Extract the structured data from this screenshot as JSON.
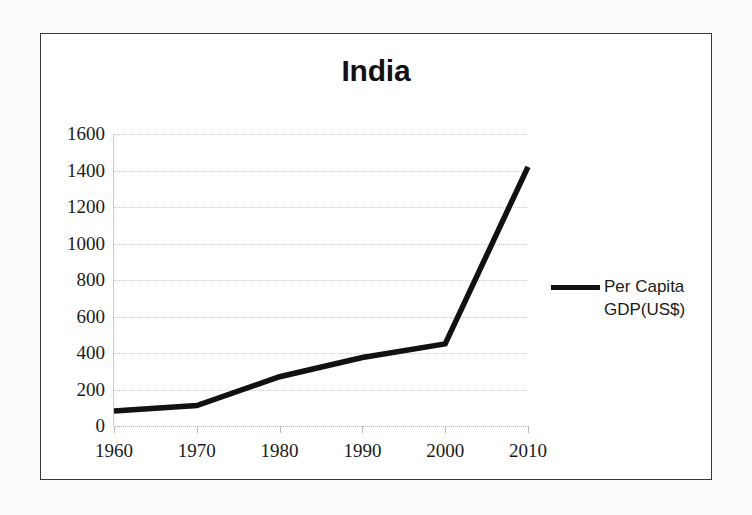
{
  "chart_data": {
    "type": "line",
    "title": "India",
    "xlabel": "",
    "ylabel": "",
    "x": [
      1960,
      1970,
      1980,
      1990,
      2000,
      2010
    ],
    "categories": [
      "1960",
      "1970",
      "1980",
      "1990",
      "2000",
      "2010"
    ],
    "series": [
      {
        "name": "Per Capita GDP(US$)",
        "values": [
          82,
          112,
          270,
          375,
          450,
          1420
        ]
      }
    ],
    "values": [
      82,
      112,
      270,
      375,
      450,
      1420
    ],
    "ylim": [
      0,
      1600
    ],
    "xlim": [
      1960,
      2010
    ],
    "y_ticks": [
      0,
      200,
      400,
      600,
      800,
      1000,
      1200,
      1400,
      1600
    ],
    "y_tick_labels": [
      "0",
      "200",
      "400",
      "600",
      "800",
      "1000",
      "1200",
      "1400",
      "1600"
    ],
    "x_ticks": [
      1960,
      1970,
      1980,
      1990,
      2000,
      2010
    ],
    "x_tick_labels": [
      "1960",
      "1970",
      "1980",
      "1990",
      "2000",
      "2010"
    ],
    "grid": true,
    "grid_axis": "y",
    "legend": {
      "position": "right",
      "entries": [
        {
          "label_line1": "Per Capita",
          "label_line2": "GDP(US$)",
          "label": "Per Capita GDP(US$)",
          "color": "#111111",
          "marker": "line"
        }
      ]
    },
    "colors": {
      "series_line": "#111111",
      "gridline": "#c9c9c9",
      "axis_text": "#1a1a1a",
      "frame_border": "#3a3a3a",
      "plot_background": "#ffffff",
      "page_background": "#fbfbfb"
    }
  }
}
